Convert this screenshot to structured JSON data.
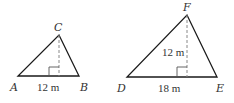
{
  "diagram": {
    "triangles": [
      {
        "id": "ABC",
        "vertices": {
          "A": {
            "label": "A",
            "x": 18,
            "y": 76
          },
          "B": {
            "label": "B",
            "x": 79,
            "y": 76
          },
          "C": {
            "label": "C",
            "x": 59,
            "y": 35
          }
        },
        "altitude_foot": {
          "x": 59,
          "y": 76
        },
        "measurements": {
          "base": "12 m"
        }
      },
      {
        "id": "DEF",
        "vertices": {
          "D": {
            "label": "D",
            "x": 127,
            "y": 77
          },
          "E": {
            "label": "E",
            "x": 217,
            "y": 77
          },
          "F": {
            "label": "F",
            "x": 187,
            "y": 15
          }
        },
        "altitude_foot": {
          "x": 187,
          "y": 77
        },
        "measurements": {
          "height": "12 m",
          "base": "18 m"
        }
      }
    ],
    "colors": {
      "edge": "#1a1a1a",
      "altitude": "#888888",
      "text": "#333333",
      "background": "#ffffff"
    }
  }
}
